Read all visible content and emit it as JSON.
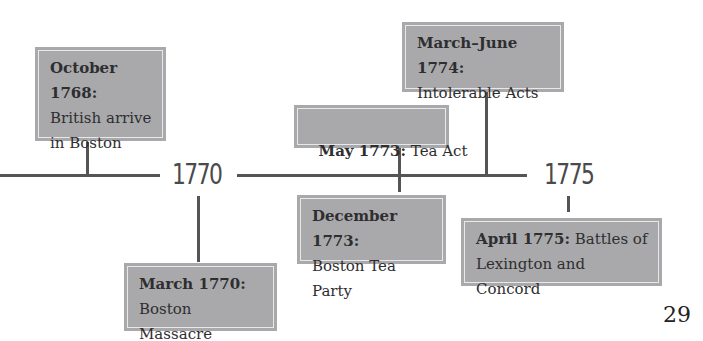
{
  "timeline": {
    "year_markers": [
      {
        "label": "1770"
      },
      {
        "label": "1775"
      }
    ],
    "events": [
      {
        "date": "October 1768:",
        "text_line1": "British arrive",
        "text_line2": "in Boston",
        "position": "above"
      },
      {
        "date": "March 1770:",
        "text_line1": "Boston Massacre",
        "position": "below"
      },
      {
        "date": "May 1773:",
        "text_line1": " Tea Act",
        "position": "above"
      },
      {
        "date": "December 1773:",
        "text_line1": "Boston Tea Party",
        "position": "below"
      },
      {
        "date": "March–June 1774:",
        "text_line1": "Intolerable Acts",
        "position": "above"
      },
      {
        "date": "April 1775:",
        "text_line1": " Battles of",
        "text_line2": "Lexington and Concord",
        "position": "below"
      }
    ]
  },
  "page": {
    "number": "29"
  },
  "colors": {
    "box_fill": "#a9a9ab",
    "line": "#555558",
    "text": "#2e2e30"
  }
}
